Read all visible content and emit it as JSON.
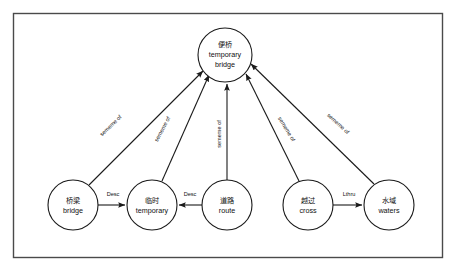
{
  "diagram": {
    "type": "semantic-network-graph",
    "frame": {
      "x": 13,
      "y": 13,
      "width": 430,
      "height": 245
    },
    "nodes": [
      {
        "id": "temporary-bridge",
        "cn": "便桥",
        "en_line1": "temporary",
        "en_line2": "bridge",
        "cx": 225,
        "cy": 55,
        "r": 27
      },
      {
        "id": "bridge",
        "cn": "桥梁",
        "en_line1": "bridge",
        "en_line2": "",
        "cx": 73,
        "cy": 205,
        "r": 25
      },
      {
        "id": "temporary",
        "cn": "临时",
        "en_line1": "temporary",
        "en_line2": "",
        "cx": 152,
        "cy": 205,
        "r": 25
      },
      {
        "id": "route",
        "cn": "道路",
        "en_line1": "route",
        "en_line2": "",
        "cx": 227,
        "cy": 205,
        "r": 25
      },
      {
        "id": "cross",
        "cn": "越过",
        "en_line1": "cross",
        "en_line2": "",
        "cx": 308,
        "cy": 205,
        "r": 25
      },
      {
        "id": "waters",
        "cn": "水域",
        "en_line1": "waters",
        "en_line2": "",
        "cx": 389,
        "cy": 205,
        "r": 25
      }
    ],
    "edges": [
      {
        "id": "bridge-to-temporary-bridge",
        "from": "bridge",
        "to": "temporary-bridge",
        "label": "sememe of",
        "label_x": 112,
        "label_y": 127,
        "label_rotate": -44
      },
      {
        "id": "temporary-to-temporary-bridge",
        "from": "temporary",
        "to": "temporary-bridge",
        "label": "sememe of",
        "label_x": 164,
        "label_y": 130,
        "label_rotate": -62
      },
      {
        "id": "route-to-temporary-bridge",
        "from": "route",
        "to": "temporary-bridge",
        "label": "sememe of",
        "label_x": 221,
        "label_y": 134,
        "label_rotate": -90
      },
      {
        "id": "cross-to-temporary-bridge",
        "from": "cross",
        "to": "temporary-bridge",
        "label": "sememe of",
        "label_x": 285,
        "label_y": 130,
        "label_rotate": 59
      },
      {
        "id": "waters-to-temporary-bridge",
        "from": "waters",
        "to": "temporary-bridge",
        "label": "sememe of",
        "label_x": 337,
        "label_y": 125,
        "label_rotate": 42
      },
      {
        "id": "bridge-to-temporary",
        "from": "bridge",
        "to": "temporary",
        "label": "Desc",
        "label_x": 113,
        "label_y": 196,
        "label_rotate": 0
      },
      {
        "id": "route-to-temporary",
        "from": "route",
        "to": "temporary",
        "label": "Desc",
        "label_x": 190,
        "label_y": 196,
        "label_rotate": 0
      },
      {
        "id": "cross-to-waters",
        "from": "cross",
        "to": "waters",
        "label": "Lthru",
        "label_x": 349,
        "label_y": 196,
        "label_rotate": 0
      }
    ],
    "colors": {
      "stroke": "#1a1a1a",
      "frame": "#4a4a4a",
      "background": "#ffffff",
      "text": "#101010"
    }
  }
}
